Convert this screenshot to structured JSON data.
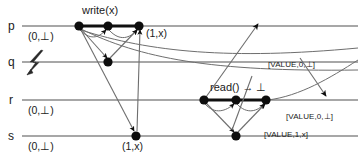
{
  "figure": {
    "type": "distributed-systems-spacetime-diagram",
    "width": 358,
    "height": 163,
    "background": "#ffffff",
    "line_color": "#8a8a8a",
    "bold_line_color": "#101010",
    "dot_color": "#0d0d0d",
    "arrow_color": "#6e6e6e"
  },
  "processes": [
    {
      "id": "p",
      "label": "p",
      "y": 26,
      "initial_state": "(0,⊥)",
      "crashed": false
    },
    {
      "id": "q",
      "label": "q",
      "y": 62,
      "initial_state": "",
      "crashed": true
    },
    {
      "id": "r",
      "label": "r",
      "y": 100,
      "initial_state": "(0,⊥)",
      "crashed": false
    },
    {
      "id": "s",
      "label": "s",
      "y": 136,
      "initial_state": "(0,⊥)",
      "crashed": false
    }
  ],
  "operations": [
    {
      "name": "write-operation",
      "label": "write(x)",
      "process": "p",
      "x": 108,
      "y": 14
    },
    {
      "name": "read-operation",
      "label": "read() → ⊥",
      "process": "r",
      "x": 236,
      "y": 89
    }
  ],
  "state_labels": [
    {
      "name": "p-initial-state",
      "text": "(0,⊥)",
      "x": 30,
      "y": 39
    },
    {
      "name": "p-final-state",
      "text": "(1,x)",
      "x": 148,
      "y": 36
    },
    {
      "name": "r-initial-state",
      "text": "(0,⊥)",
      "x": 30,
      "y": 113
    },
    {
      "name": "s-initial-state",
      "text": "(0,⊥)",
      "x": 30,
      "y": 149
    },
    {
      "name": "s-final-state",
      "text": "(1,x)",
      "x": 124,
      "y": 149
    }
  ],
  "message_labels": [
    {
      "name": "message-value-0-bot-upper",
      "text": "[VALUE,0,⊥]",
      "x": 268,
      "y": 67
    },
    {
      "name": "message-value-0-bot-lower",
      "text": "[VALUE,0,⊥]",
      "x": 288,
      "y": 119
    },
    {
      "name": "message-value-1-x",
      "text": "[VALUE,1,x]",
      "x": 266,
      "y": 137
    }
  ],
  "events": [
    {
      "name": "event-p-1",
      "process": "p",
      "x": 79,
      "y": 26
    },
    {
      "name": "event-p-2",
      "process": "p",
      "x": 108,
      "y": 26
    },
    {
      "name": "event-p-3",
      "process": "p",
      "x": 139,
      "y": 26
    },
    {
      "name": "event-q-1",
      "process": "q",
      "x": 108,
      "y": 62
    },
    {
      "name": "event-r-1",
      "process": "r",
      "x": 204,
      "y": 100
    },
    {
      "name": "event-r-2",
      "process": "r",
      "x": 236,
      "y": 100
    },
    {
      "name": "event-r-3",
      "process": "r",
      "x": 266,
      "y": 100
    },
    {
      "name": "event-s-1",
      "process": "s",
      "x": 136,
      "y": 136
    },
    {
      "name": "event-s-2",
      "process": "s",
      "x": 236,
      "y": 136
    }
  ],
  "crash_marker": {
    "name": "crash-bolt-icon",
    "process": "q",
    "x": 34,
    "y": 62,
    "symbol": "lightning-bolt"
  }
}
